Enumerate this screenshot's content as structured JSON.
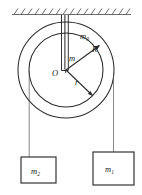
{
  "figure": {
    "type": "physics-diagram",
    "labels": {
      "pulley_mass": "m",
      "pulley_mass_sub": "0",
      "inner_mass": "m",
      "outer_radius": "R",
      "inner_radius": "r",
      "center": "O",
      "block_right": "m",
      "block_right_sub": "1",
      "block_left": "m",
      "block_left_sub": "2"
    },
    "colors": {
      "ink": "#2b2b2b",
      "thin_ink": "#555555",
      "hatch": "#3a3a3a",
      "background": "#ffffff"
    },
    "geometry": {
      "center_x": 66,
      "center_y": 70,
      "outer_radius_px": 48,
      "inner_radius_px": 37,
      "ceiling_y": 14,
      "hatch_count": 17
    }
  }
}
